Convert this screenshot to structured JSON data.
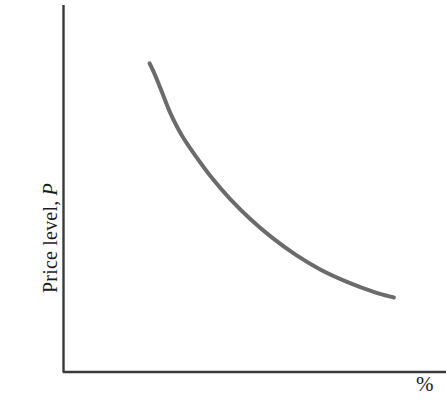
{
  "figure": {
    "background_color": "#ffffff",
    "width": 446,
    "height": 416
  },
  "axes": {
    "y_axis": {
      "label_prefix": "Price level, ",
      "label_variable": "P",
      "color": "#3a3a3a"
    },
    "x_axis": {
      "label": "%",
      "color": "#3a3a3a"
    }
  },
  "chart_data": {
    "type": "line",
    "title": "",
    "xlabel": "%",
    "ylabel": "Price level, P",
    "grid": false,
    "legend": null,
    "axis_ticks": {
      "x": [],
      "y": []
    },
    "xlim": [
      0,
      100
    ],
    "ylim": [
      0,
      100
    ],
    "series": [
      {
        "name": "downward-sloping curve",
        "color": "#6b6b6b",
        "line_width": 4,
        "points": [
          [
            22.6,
            84.1
          ],
          [
            24.0,
            81.0
          ],
          [
            25.9,
            76.1
          ],
          [
            28.0,
            70.6
          ],
          [
            31.0,
            64.5
          ],
          [
            34.6,
            58.9
          ],
          [
            38.8,
            53.0
          ],
          [
            43.6,
            47.2
          ],
          [
            48.9,
            41.7
          ],
          [
            54.6,
            36.6
          ],
          [
            60.8,
            31.9
          ],
          [
            67.4,
            27.8
          ],
          [
            74.3,
            24.5
          ],
          [
            81.5,
            21.7
          ],
          [
            86.4,
            20.3
          ]
        ]
      }
    ]
  }
}
